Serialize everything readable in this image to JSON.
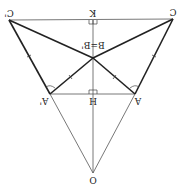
{
  "diagram": {
    "title": "",
    "orientation": "rotated 180 degrees",
    "colors": {
      "line": "#222222",
      "thin_line": "#555555",
      "background": "#ffffff"
    },
    "points": {
      "C_prime": {
        "label": "C'",
        "x": 9,
        "y": 20
      },
      "C": {
        "label": "C",
        "x": 173,
        "y": 19
      },
      "K": {
        "label": "K",
        "x": 93,
        "y": 20
      },
      "B": {
        "label": "B=B'",
        "x": 93,
        "y": 58
      },
      "A_prime": {
        "label": "A'",
        "x": 50,
        "y": 94
      },
      "A": {
        "label": "A",
        "x": 135,
        "y": 94
      },
      "H": {
        "label": "H",
        "x": 93,
        "y": 94
      },
      "O": {
        "label": "O",
        "x": 93,
        "y": 173
      }
    },
    "labels": {
      "C_prime": "C'",
      "C": "C",
      "K": "K",
      "B": "B=B'",
      "A_prime": "A'",
      "A": "A",
      "H": "H",
      "O": "O"
    }
  }
}
